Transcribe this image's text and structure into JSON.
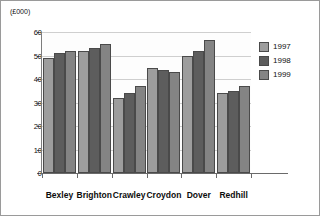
{
  "chart": {
    "unit_caption": "(£000)",
    "title": "",
    "legend_position": "right"
  },
  "chart_data": {
    "type": "bar",
    "title": "",
    "subtitle": "",
    "xlabel": "",
    "ylabel": "(£000)",
    "ylim": [
      0,
      60
    ],
    "yticks": [
      0,
      10,
      20,
      30,
      40,
      50,
      60
    ],
    "ytick_labels": [
      "0",
      "10",
      "20",
      "30",
      "40",
      "50",
      "60"
    ],
    "grid": true,
    "legend": [
      "1997",
      "1998",
      "1999"
    ],
    "categories": [
      "Bexley",
      "Brighton",
      "Crawley",
      "Croydon",
      "Dover",
      "Redhill"
    ],
    "series": [
      {
        "name": "1997",
        "color": "#9d9d9d",
        "values": [
          49,
          52,
          32,
          44.5,
          50,
          34
        ]
      },
      {
        "name": "1998",
        "color": "#5d5d5d",
        "values": [
          51,
          53,
          34,
          44,
          52,
          35
        ]
      },
      {
        "name": "1999",
        "color": "#848484",
        "values": [
          52,
          55,
          37,
          43,
          56.5,
          37
        ]
      }
    ]
  }
}
